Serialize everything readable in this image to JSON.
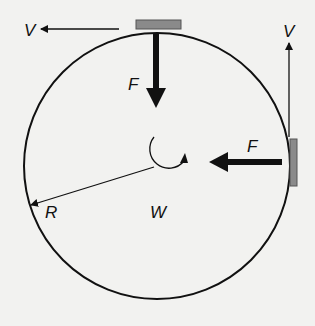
{
  "diagram": {
    "labels": {
      "velocity_top": "V",
      "force_top": "F",
      "velocity_right": "V",
      "force_right": "F",
      "radius": "R",
      "angular_velocity": "W"
    },
    "colors": {
      "background": "#f2f2f0",
      "line": "#111111",
      "block": "#8a8a8a",
      "block_border": "#555555"
    }
  }
}
